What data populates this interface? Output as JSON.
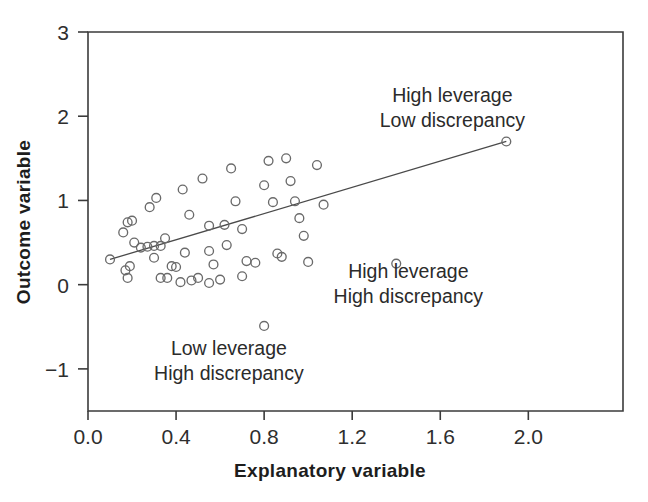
{
  "chart_data": {
    "type": "scatter",
    "title": "",
    "xlabel": "Explanatory variable",
    "ylabel": "Outcome variable",
    "xlim": [
      0.0,
      2.43
    ],
    "ylim": [
      -1.5,
      3.0
    ],
    "grid": false,
    "legend": "none",
    "xticks": [
      "0.0",
      "0.4",
      "0.8",
      "1.2",
      "1.6",
      "2.0"
    ],
    "xtick_values": [
      0.0,
      0.4,
      0.8,
      1.2,
      1.6,
      2.0
    ],
    "yticks": [
      "3",
      "2",
      "1",
      "0",
      "-1"
    ],
    "ytick_values": [
      3,
      2,
      1,
      0,
      -1
    ],
    "marker": "open-circle",
    "marker_color": "#6a6a6a",
    "points": [
      [
        0.1,
        0.3
      ],
      [
        0.16,
        0.62
      ],
      [
        0.18,
        0.74
      ],
      [
        0.2,
        0.76
      ],
      [
        0.17,
        0.17
      ],
      [
        0.19,
        0.22
      ],
      [
        0.18,
        0.08
      ],
      [
        0.21,
        0.5
      ],
      [
        0.24,
        0.44
      ],
      [
        0.27,
        0.45
      ],
      [
        0.3,
        0.46
      ],
      [
        0.28,
        0.92
      ],
      [
        0.31,
        1.03
      ],
      [
        0.33,
        0.46
      ],
      [
        0.3,
        0.32
      ],
      [
        0.33,
        0.08
      ],
      [
        0.36,
        0.08
      ],
      [
        0.35,
        0.55
      ],
      [
        0.38,
        0.22
      ],
      [
        0.4,
        0.21
      ],
      [
        0.43,
        1.13
      ],
      [
        0.46,
        0.83
      ],
      [
        0.44,
        0.38
      ],
      [
        0.42,
        0.03
      ],
      [
        0.47,
        0.05
      ],
      [
        0.5,
        0.08
      ],
      [
        0.52,
        1.26
      ],
      [
        0.55,
        0.7
      ],
      [
        0.55,
        0.4
      ],
      [
        0.57,
        0.24
      ],
      [
        0.55,
        0.02
      ],
      [
        0.6,
        0.06
      ],
      [
        0.62,
        0.71
      ],
      [
        0.63,
        0.47
      ],
      [
        0.65,
        1.38
      ],
      [
        0.67,
        0.99
      ],
      [
        0.7,
        0.66
      ],
      [
        0.72,
        0.28
      ],
      [
        0.7,
        0.1
      ],
      [
        0.76,
        0.26
      ],
      [
        0.8,
        -0.49
      ],
      [
        0.8,
        1.18
      ],
      [
        0.82,
        1.47
      ],
      [
        0.84,
        0.98
      ],
      [
        0.86,
        0.37
      ],
      [
        0.88,
        0.33
      ],
      [
        0.9,
        1.5
      ],
      [
        0.92,
        1.23
      ],
      [
        0.94,
        0.99
      ],
      [
        0.96,
        0.79
      ],
      [
        0.98,
        0.58
      ],
      [
        1.0,
        0.27
      ],
      [
        1.04,
        1.42
      ],
      [
        1.07,
        0.95
      ],
      [
        1.4,
        0.25
      ],
      [
        1.9,
        1.7
      ]
    ],
    "fit_line": {
      "name": "regression line",
      "x": [
        0.1,
        1.9
      ],
      "y": [
        0.3,
        1.7
      ]
    },
    "annotations": [
      {
        "id": "high-leverage-low-discrepancy",
        "line1": "High leverage",
        "line2": "Low discrepancy",
        "x": 1.655,
        "y": 2.17
      },
      {
        "id": "high-leverage-high-discrepancy",
        "line1": "High leverage",
        "line2": "High discrepancy",
        "x": 1.455,
        "y": 0.08
      },
      {
        "id": "low-leverage-high-discrepancy",
        "line1": "Low leverage",
        "line2": "High discrepancy",
        "x": 0.64,
        "y": -0.84
      }
    ]
  }
}
